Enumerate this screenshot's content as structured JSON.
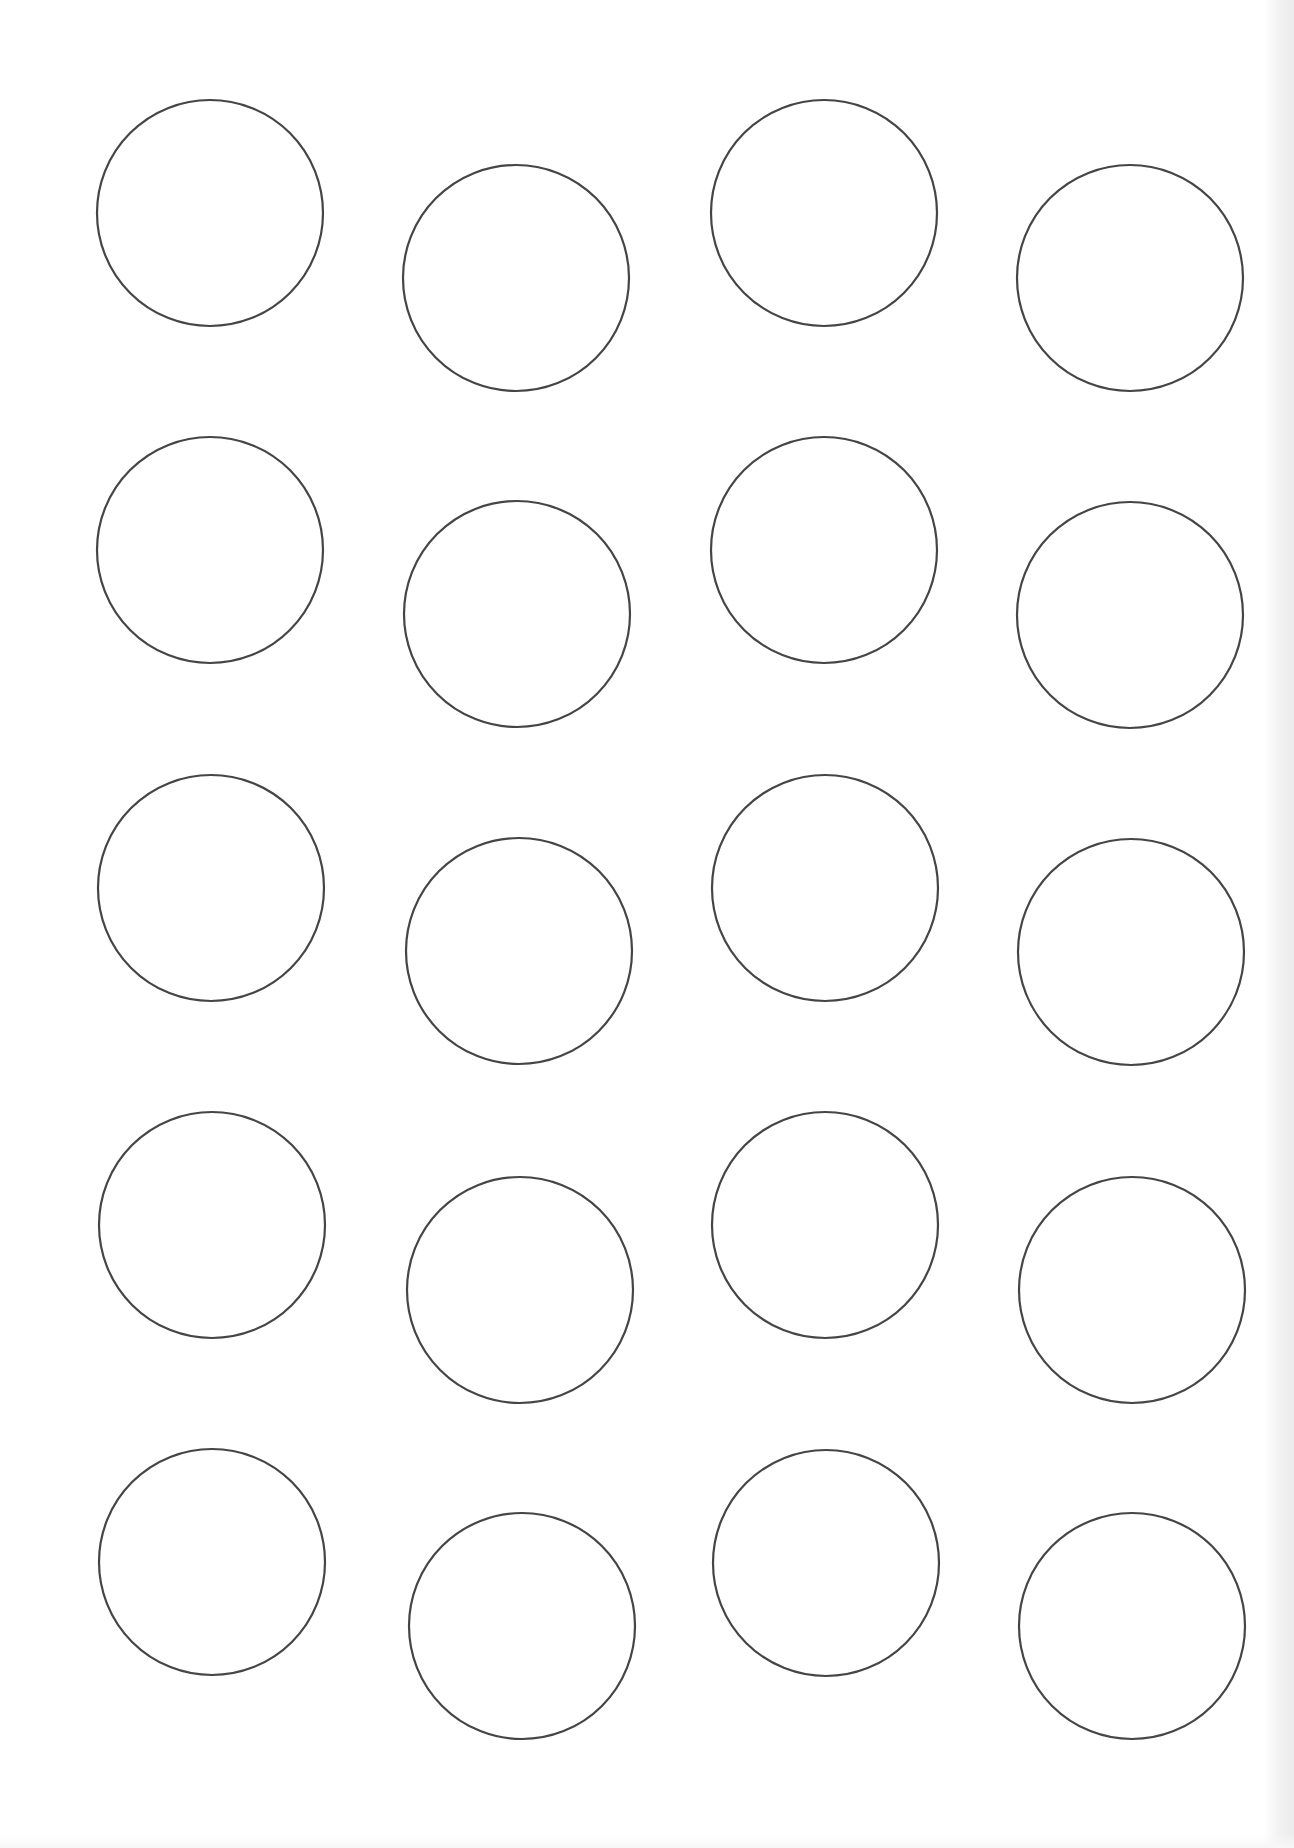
{
  "sheet": {
    "description": "Printable round label template sheet, 4 columns x 5 rows of circle outlines (staggered)",
    "columns": 4,
    "rows": 5,
    "circle_radius": 113,
    "stroke_color": "#454545",
    "background_color": "#ffffff",
    "circles": [
      {
        "row": 1,
        "col": 1,
        "cx": 210,
        "cy": 213
      },
      {
        "row": 1,
        "col": 2,
        "cx": 516,
        "cy": 278
      },
      {
        "row": 1,
        "col": 3,
        "cx": 824,
        "cy": 213
      },
      {
        "row": 1,
        "col": 4,
        "cx": 1130,
        "cy": 278
      },
      {
        "row": 2,
        "col": 1,
        "cx": 210,
        "cy": 550
      },
      {
        "row": 2,
        "col": 2,
        "cx": 517,
        "cy": 614
      },
      {
        "row": 2,
        "col": 3,
        "cx": 824,
        "cy": 550
      },
      {
        "row": 2,
        "col": 4,
        "cx": 1130,
        "cy": 615
      },
      {
        "row": 3,
        "col": 1,
        "cx": 211,
        "cy": 888
      },
      {
        "row": 3,
        "col": 2,
        "cx": 519,
        "cy": 951
      },
      {
        "row": 3,
        "col": 3,
        "cx": 825,
        "cy": 888
      },
      {
        "row": 3,
        "col": 4,
        "cx": 1131,
        "cy": 952
      },
      {
        "row": 4,
        "col": 1,
        "cx": 212,
        "cy": 1225
      },
      {
        "row": 4,
        "col": 2,
        "cx": 520,
        "cy": 1290
      },
      {
        "row": 4,
        "col": 3,
        "cx": 825,
        "cy": 1225
      },
      {
        "row": 4,
        "col": 4,
        "cx": 1132,
        "cy": 1290
      },
      {
        "row": 5,
        "col": 1,
        "cx": 212,
        "cy": 1562
      },
      {
        "row": 5,
        "col": 2,
        "cx": 522,
        "cy": 1626
      },
      {
        "row": 5,
        "col": 3,
        "cx": 826,
        "cy": 1563
      },
      {
        "row": 5,
        "col": 4,
        "cx": 1132,
        "cy": 1626
      }
    ]
  }
}
